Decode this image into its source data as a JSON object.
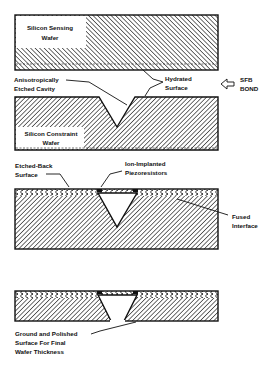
{
  "diagram": {
    "colors": {
      "ink": "#111111",
      "paper": "#ffffff",
      "hatch": "#222222"
    },
    "stage1": {
      "wafer_label_line1": "Silicon Sensing",
      "wafer_label_line2": "Wafer"
    },
    "annotations_bond": {
      "cavity_line1": "Anisotropically",
      "cavity_line2": "Etched Cavity",
      "hydrated_line1": "Hydrated",
      "hydrated_line2": "Surface",
      "sfb_line1": "SFB",
      "sfb_line2": "BOND",
      "arrow_icon": "left-arrow-icon"
    },
    "stage2": {
      "wafer_label_line1": "Silicon Constraint",
      "wafer_label_line2": "Wafer"
    },
    "stage3": {
      "etched_line1": "Etched-Back",
      "etched_line2": "Surface",
      "ion_line1": "Ion-Implanted",
      "ion_line2": "Piezoresistors",
      "fused_line1": "Fused",
      "fused_line2": "Interface"
    },
    "stage4": {
      "ground_line1": "Ground and Polished",
      "ground_line2": "Surface For Final",
      "ground_line3": "Wafer Thickness"
    }
  }
}
